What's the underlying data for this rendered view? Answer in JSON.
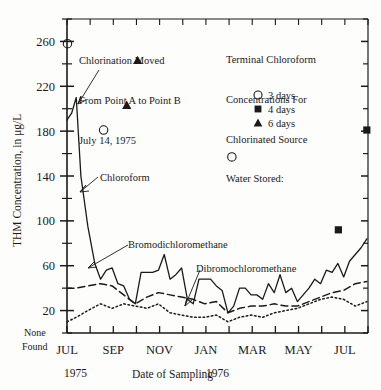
{
  "chart_data": {
    "type": "line",
    "title": "",
    "xlabel": "Date of Sampling",
    "ylabel": "THM Concentration, in μg/L",
    "ylim": [
      0,
      280
    ],
    "yticks_major": [
      20,
      60,
      100,
      140,
      180,
      220,
      260
    ],
    "ytick_labels": [
      "20",
      "60",
      "100",
      "140",
      "180",
      "220",
      "260"
    ],
    "y_zero_label": "None\nFound",
    "y_zero_label_line1": "None",
    "y_zero_label_line2": "Found",
    "grid": false,
    "xtick_labels": [
      "JUL",
      "SEP",
      "NOV",
      "JAN",
      "MAR",
      "MAY",
      "JUL"
    ],
    "x_year_left": "1975",
    "x_year_mid": "1976",
    "xlim_months": [
      0,
      13
    ],
    "series": [
      {
        "name": "Chloroform",
        "style": "solid",
        "x": [
          0.0,
          0.2,
          0.4,
          0.6,
          0.9,
          1.2,
          1.45,
          1.7,
          1.95,
          2.2,
          2.45,
          2.7,
          2.95,
          3.2,
          3.45,
          3.7,
          3.95,
          4.2,
          4.45,
          4.7,
          4.95,
          5.2,
          5.45,
          5.7,
          5.95,
          6.2,
          6.45,
          6.7,
          6.95,
          7.2,
          7.45,
          7.7,
          7.95,
          8.2,
          8.45,
          8.7,
          8.95,
          9.2,
          9.45,
          9.7,
          9.95,
          10.2,
          10.45,
          10.7,
          10.95,
          11.2,
          11.45,
          11.7,
          11.95,
          12.2,
          12.45,
          12.7,
          12.95
        ],
        "values": [
          190,
          196,
          210,
          140,
          95,
          62,
          48,
          56,
          58,
          44,
          42,
          30,
          26,
          54,
          54,
          54,
          56,
          70,
          48,
          52,
          58,
          30,
          26,
          48,
          48,
          48,
          42,
          38,
          18,
          24,
          40,
          40,
          34,
          34,
          30,
          44,
          36,
          52,
          36,
          40,
          28,
          34,
          40,
          48,
          44,
          56,
          54,
          62,
          50,
          64,
          70,
          76,
          84
        ]
      },
      {
        "name": "Bromodichloromethane",
        "style": "dashed",
        "x": [
          0.0,
          0.4,
          0.9,
          1.45,
          1.95,
          2.45,
          2.95,
          3.45,
          3.95,
          4.45,
          4.95,
          5.45,
          5.95,
          6.45,
          6.95,
          7.45,
          7.95,
          8.45,
          8.95,
          9.45,
          9.95,
          10.45,
          10.95,
          11.45,
          11.95,
          12.45,
          12.95
        ],
        "values": [
          40,
          40,
          42,
          44,
          42,
          34,
          26,
          32,
          36,
          34,
          32,
          30,
          26,
          28,
          18,
          22,
          24,
          24,
          26,
          24,
          24,
          28,
          32,
          36,
          38,
          44,
          46
        ]
      },
      {
        "name": "Dibromochloromethane",
        "style": "dotted",
        "x": [
          0.0,
          0.4,
          0.9,
          1.45,
          1.95,
          2.45,
          2.95,
          3.45,
          3.95,
          4.45,
          4.95,
          5.45,
          5.95,
          6.45,
          6.95,
          7.45,
          7.95,
          8.45,
          8.95,
          9.45,
          9.95,
          10.45,
          10.95,
          11.45,
          11.95,
          12.45,
          12.95
        ],
        "values": [
          10,
          14,
          20,
          26,
          22,
          26,
          24,
          22,
          26,
          18,
          16,
          14,
          14,
          16,
          10,
          14,
          16,
          14,
          18,
          20,
          22,
          26,
          30,
          32,
          30,
          24,
          28
        ]
      }
    ],
    "markers": [
      {
        "series": "3 days",
        "shape": "circle",
        "x": 0.02,
        "value": 258
      },
      {
        "series": "6 days",
        "shape": "triangle",
        "x": 3.05,
        "value": 243
      },
      {
        "series": "6 days",
        "shape": "triangle",
        "x": 2.58,
        "value": 203
      },
      {
        "series": "3 days",
        "shape": "circle",
        "x": 1.58,
        "value": 181
      },
      {
        "series": "3 days",
        "shape": "circle",
        "x": 7.12,
        "value": 157
      },
      {
        "series": "4 days",
        "shape": "square",
        "x": 11.72,
        "value": 92
      },
      {
        "series": "4 days",
        "shape": "square",
        "x": 12.95,
        "value": 181
      }
    ],
    "legend": {
      "position": "top-right-inside",
      "title_lines": [
        "Terminal Chloroform",
        "Concentrations For",
        "Chlorinated Source",
        "Water Stored:"
      ],
      "entries": [
        {
          "shape": "circle",
          "label": "3 days"
        },
        {
          "shape": "square",
          "label": "4 days"
        },
        {
          "shape": "triangle",
          "label": "6 days"
        }
      ]
    },
    "annotations": [
      {
        "name": "chlorination-moved-note",
        "lines": [
          "Chlorination Moved",
          "From Point A to Point B",
          "July 14, 1975"
        ]
      },
      {
        "name": "chloroform-label",
        "text": "Chloroform"
      },
      {
        "name": "bromodichloromethane-label",
        "text": "Bromodichloromethane"
      },
      {
        "name": "dibromochloromethane-label",
        "text": "Dibromochloromethane"
      }
    ],
    "colors": {
      "ink": "#1a1a1a",
      "axis": "#333333",
      "background": "#fdfdfc"
    }
  }
}
